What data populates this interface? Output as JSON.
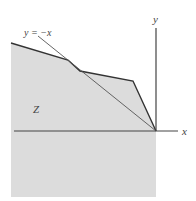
{
  "diagram": {
    "region_label": "Z",
    "line_label": "y = −x",
    "x_axis_label": "x",
    "y_axis_label": "y",
    "colors": {
      "region_fill": "#dcdcdc",
      "boundary": "#333333",
      "axis": "#444444",
      "diagonal": "#555555",
      "background": "#ffffff"
    }
  }
}
